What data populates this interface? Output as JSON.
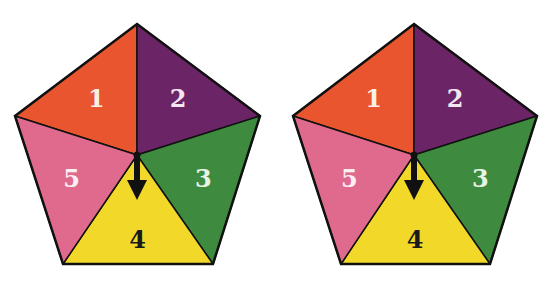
{
  "figures": [
    {
      "name": "pentagon-left",
      "pointer_target": "4",
      "sectors": [
        {
          "label": "1",
          "color": "#E8552F",
          "text_color": "#FBEFEA"
        },
        {
          "label": "2",
          "color": "#6B2466",
          "text_color": "#F3E6F0"
        },
        {
          "label": "3",
          "color": "#3E8A3E",
          "text_color": "#E8F3E6"
        },
        {
          "label": "4",
          "color": "#F2D829",
          "text_color": "#1A1A1A"
        },
        {
          "label": "5",
          "color": "#E06A8E",
          "text_color": "#FCEFF3"
        }
      ]
    },
    {
      "name": "pentagon-right",
      "pointer_target": "4",
      "sectors": [
        {
          "label": "1",
          "color": "#E8552F",
          "text_color": "#FBEFEA"
        },
        {
          "label": "2",
          "color": "#6B2466",
          "text_color": "#F3E6F0"
        },
        {
          "label": "3",
          "color": "#3E8A3E",
          "text_color": "#E8F3E6"
        },
        {
          "label": "4",
          "color": "#F2D829",
          "text_color": "#1A1A1A"
        },
        {
          "label": "5",
          "color": "#E06A8E",
          "text_color": "#FCEFF3"
        }
      ]
    }
  ],
  "colors": {
    "outline": "#111111",
    "pointer": "#111111"
  }
}
